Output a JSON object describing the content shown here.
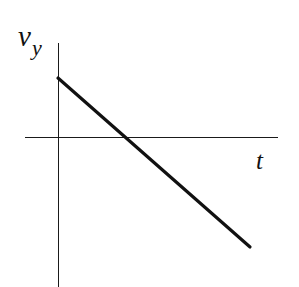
{
  "figure": {
    "background_color": "#ffffff",
    "width": 299,
    "height": 287
  },
  "labels": {
    "y_axis_symbol": "v",
    "y_axis_subscript": "y",
    "x_axis_symbol": "t"
  },
  "chart_data": {
    "type": "line",
    "title": "",
    "subtitle": "",
    "xlabel": "t",
    "ylabel": "v_y",
    "grid": false,
    "legend": null,
    "annotations": [],
    "axes": {
      "origin_px": {
        "x": 58,
        "y": 137
      },
      "x_axis_px": {
        "x1": 25,
        "y1": 137,
        "x2": 278,
        "y2": 137
      },
      "y_axis_px": {
        "x1": 58,
        "y1": 43,
        "x2": 58,
        "y2": 287
      },
      "xlim": [
        -0.17,
        1.15
      ],
      "ylim": [
        -0.88,
        0.31
      ],
      "x_ticks": [],
      "y_ticks": [],
      "axis_color": "#1a1a1a",
      "axis_width_px": 1.6
    },
    "series": [
      {
        "name": "v_y(t)",
        "color": "#111111",
        "line_width_px": 3.2,
        "style": "solid",
        "x": [
          0,
          0.33,
          1.0
        ],
        "y": [
          0.307,
          0.0,
          -0.573
        ],
        "points_px": [
          {
            "x": 58,
            "y": 78
          },
          {
            "x": 122,
            "y": 137
          },
          {
            "x": 250,
            "y": 247
          }
        ],
        "slope": -0.88,
        "intercept": 0.307,
        "zero_crossing_x": 0.33,
        "zero_crossing_px_x": 122,
        "description": "Straight line of constant negative slope, starting positive on the v_y axis and decreasing linearly through zero into negative values."
      }
    ]
  }
}
